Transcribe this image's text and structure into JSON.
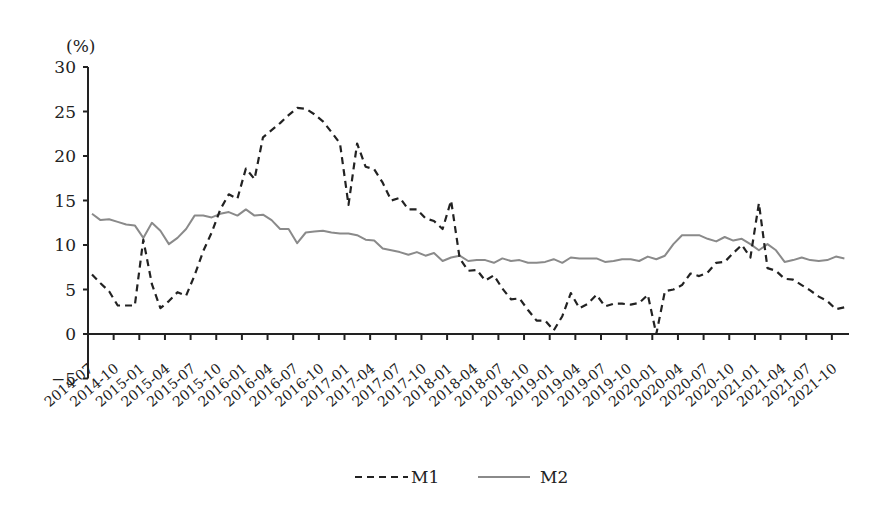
{
  "chart_data": {
    "type": "line",
    "title": "",
    "unit_label": "(%)",
    "xlabel": "",
    "ylabel": "(%)",
    "ylim": [
      -5,
      30
    ],
    "yticks": [
      30,
      25,
      20,
      15,
      10,
      5,
      0,
      -5
    ],
    "grid": false,
    "legend_position": "bottom",
    "x_start": "2014-07",
    "x_frequency": "monthly",
    "xtick_labels": [
      "2014-07",
      "2014-10",
      "2015-01",
      "2015-04",
      "2015-07",
      "2015-10",
      "2016-01",
      "2016-04",
      "2016-07",
      "2016-10",
      "2017-01",
      "2017-04",
      "2017-07",
      "2017-10",
      "2018-01",
      "2018-04",
      "2018-07",
      "2018-10",
      "2019-01",
      "2019-04",
      "2019-07",
      "2019-10",
      "2020-01",
      "2020-04",
      "2020-07",
      "2020-10",
      "2021-01",
      "2021-04",
      "2021-07",
      "2021-10"
    ],
    "series": [
      {
        "name": "M1",
        "style": "dashed",
        "color": "#222222",
        "values": [
          6.7,
          5.7,
          4.8,
          3.2,
          3.2,
          3.2,
          10.6,
          5.6,
          2.9,
          3.7,
          4.7,
          4.3,
          6.6,
          9.3,
          11.4,
          14.0,
          15.7,
          15.2,
          18.6,
          17.4,
          22.1,
          22.9,
          23.7,
          24.6,
          25.4,
          25.3,
          24.7,
          23.9,
          22.7,
          21.4,
          14.5,
          21.4,
          18.8,
          18.5,
          17.0,
          15.0,
          15.3,
          14.0,
          14.0,
          13.0,
          12.7,
          11.8,
          15.0,
          8.5,
          7.1,
          7.2,
          6.0,
          6.6,
          5.1,
          3.9,
          4.0,
          2.7,
          1.5,
          1.5,
          0.4,
          2.0,
          4.6,
          2.9,
          3.4,
          4.4,
          3.1,
          3.4,
          3.4,
          3.3,
          3.5,
          4.4,
          0.0,
          4.8,
          5.0,
          5.5,
          6.8,
          6.5,
          6.9,
          8.0,
          8.1,
          9.1,
          10.0,
          8.6,
          14.7,
          7.4,
          7.1,
          6.2,
          6.1,
          5.5,
          4.9,
          4.2,
          3.7,
          2.8,
          3.0
        ]
      },
      {
        "name": "M2",
        "style": "solid",
        "color": "#8a8a8a",
        "values": [
          13.5,
          12.8,
          12.9,
          12.6,
          12.3,
          12.2,
          10.8,
          12.5,
          11.6,
          10.1,
          10.8,
          11.8,
          13.3,
          13.3,
          13.1,
          13.5,
          13.7,
          13.3,
          14.0,
          13.3,
          13.4,
          12.8,
          11.8,
          11.8,
          10.2,
          11.4,
          11.5,
          11.6,
          11.4,
          11.3,
          11.3,
          11.1,
          10.6,
          10.5,
          9.6,
          9.4,
          9.2,
          8.9,
          9.2,
          8.8,
          9.1,
          8.2,
          8.6,
          8.8,
          8.2,
          8.3,
          8.3,
          8.0,
          8.5,
          8.2,
          8.3,
          8.0,
          8.0,
          8.1,
          8.4,
          8.0,
          8.6,
          8.5,
          8.5,
          8.5,
          8.1,
          8.2,
          8.4,
          8.4,
          8.2,
          8.7,
          8.4,
          8.8,
          10.1,
          11.1,
          11.1,
          11.1,
          10.7,
          10.4,
          10.9,
          10.5,
          10.7,
          10.1,
          9.4,
          10.1,
          9.4,
          8.1,
          8.3,
          8.6,
          8.3,
          8.2,
          8.3,
          8.7,
          8.5
        ]
      }
    ]
  },
  "legend": {
    "items": [
      {
        "label": "M1",
        "style": "dashed"
      },
      {
        "label": "M2",
        "style": "solid"
      }
    ]
  }
}
